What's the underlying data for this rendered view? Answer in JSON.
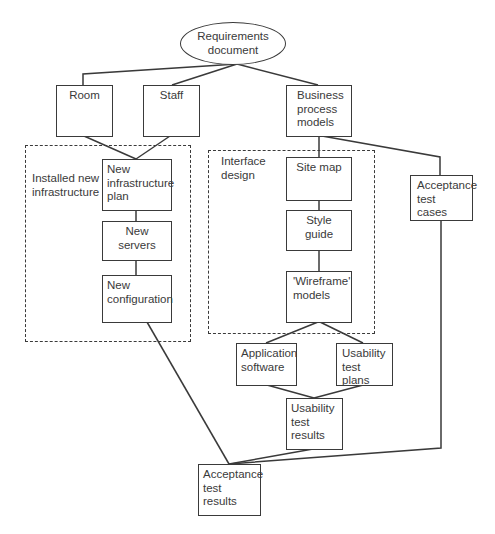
{
  "diagram": {
    "root": {
      "label": "Requirements\ndocument"
    },
    "groups": {
      "infrastructure": {
        "label": "Installed new\ninfrastructure"
      },
      "interface": {
        "label": "Interface\ndesign"
      }
    },
    "nodes": {
      "room": {
        "label": "Room"
      },
      "staff": {
        "label": "Staff"
      },
      "business_process_models": {
        "label": "Business\nprocess\nmodels"
      },
      "new_infrastructure_plan": {
        "label": "New\ninfrastructure\nplan"
      },
      "new_servers": {
        "label": "New servers"
      },
      "new_configuration": {
        "label": "New\nconfiguration"
      },
      "site_map": {
        "label": "Site map"
      },
      "style_guide": {
        "label": "Style guide"
      },
      "wireframe_models": {
        "label": "'Wireframe'\nmodels"
      },
      "acceptance_test_cases": {
        "label": "Acceptance\ntest cases"
      },
      "application_software": {
        "label": "Application\nsoftware"
      },
      "usability_test_plans": {
        "label": "Usability\ntest plans"
      },
      "usability_test_results": {
        "label": "Usability\ntest results"
      },
      "acceptance_test_results": {
        "label": "Acceptance\ntest results"
      }
    },
    "edges": [
      [
        "Requirements document",
        "Room"
      ],
      [
        "Requirements document",
        "Staff"
      ],
      [
        "Requirements document",
        "Business process models"
      ],
      [
        "Room",
        "New infrastructure plan"
      ],
      [
        "Staff",
        "New infrastructure plan"
      ],
      [
        "New infrastructure plan",
        "New servers"
      ],
      [
        "New servers",
        "New configuration"
      ],
      [
        "New configuration",
        "Acceptance test results"
      ],
      [
        "Business process models",
        "Site map"
      ],
      [
        "Business process models",
        "Acceptance test cases"
      ],
      [
        "Site map",
        "Style guide"
      ],
      [
        "Style guide",
        "'Wireframe' models"
      ],
      [
        "'Wireframe' models",
        "Application software"
      ],
      [
        "'Wireframe' models",
        "Usability test plans"
      ],
      [
        "Application software",
        "Usability test results"
      ],
      [
        "Usability test plans",
        "Usability test results"
      ],
      [
        "Usability test results",
        "Acceptance test results"
      ],
      [
        "Acceptance test cases",
        "Acceptance test results"
      ]
    ]
  }
}
